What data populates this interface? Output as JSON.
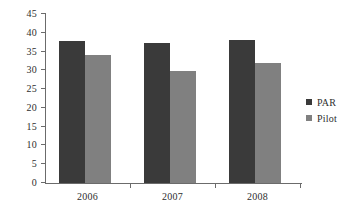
{
  "chart_data": {
    "type": "bar",
    "title": "",
    "subtitle": "",
    "xlabel": "",
    "ylabel": "",
    "categories": [
      "2006",
      "2007",
      "2008"
    ],
    "series": [
      {
        "name": "PAR",
        "values": [
          37.8,
          37.2,
          38.0
        ],
        "color": "#3a3a3a"
      },
      {
        "name": "Pilot",
        "values": [
          34.0,
          29.8,
          32.0
        ],
        "color": "#808080"
      }
    ],
    "ylim": [
      0,
      45
    ],
    "ytick_step": 5,
    "yticks": [
      "0",
      "5",
      "10",
      "15",
      "20",
      "25",
      "30",
      "35",
      "40",
      "45"
    ],
    "grid": false,
    "legend_position": "right",
    "background_color": "#ffffff",
    "axis_color": "#6b6b6b",
    "text_color": "#2e2e2e"
  },
  "legend": {
    "items": [
      {
        "label": "PAR",
        "swatch_color": "#3a3a3a"
      },
      {
        "label": "Pilot",
        "swatch_color": "#808080"
      }
    ]
  }
}
